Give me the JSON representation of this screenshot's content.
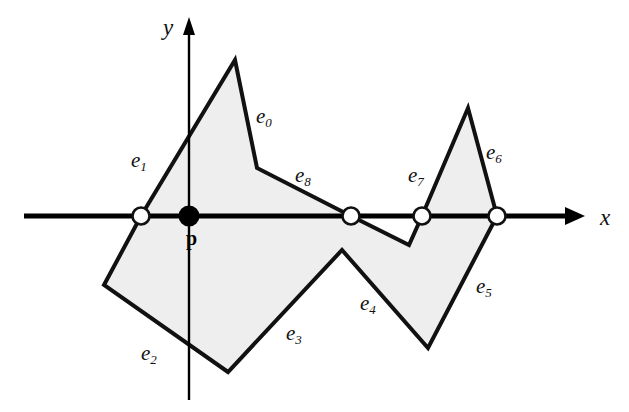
{
  "figure": {
    "background": "#ffffff",
    "polygon_fill": "#eeeeee",
    "polygon_stroke": "#111111",
    "axis_color": "#000000",
    "vertex_marker_fill": "#ffffff",
    "point_marker_fill": "#000000",
    "polygon_points": "235,60 257,168 351,216 409,245 422,216 468,108 497,216 428,348 342,250 228,372 104,285 141,216",
    "axes": {
      "x_axis": {
        "name": "x-axis",
        "x1": 24,
        "y1": 216,
        "x2": 584,
        "y2": 216,
        "label": "x",
        "label_x": 600,
        "label_y": 206
      },
      "y_axis": {
        "name": "y-axis",
        "x1": 189,
        "y1": 400,
        "x2": 189,
        "y2": 20,
        "label": "y",
        "label_x": 163,
        "label_y": 16
      }
    },
    "point": {
      "label": "p",
      "x": 189,
      "y": 216,
      "label_x": 186,
      "label_y": 228
    },
    "crossings": [
      {
        "name": "crossing-1",
        "x": 141,
        "y": 216
      },
      {
        "name": "crossing-2",
        "x": 351,
        "y": 216
      },
      {
        "name": "crossing-3",
        "x": 422,
        "y": 216
      },
      {
        "name": "crossing-4",
        "x": 497,
        "y": 216
      }
    ],
    "edge_labels": [
      {
        "id": "e0",
        "base": "e",
        "sub": "0",
        "x": 256,
        "y": 106
      },
      {
        "id": "e1",
        "base": "e",
        "sub": "1",
        "x": 131,
        "y": 150
      },
      {
        "id": "e2",
        "base": "e",
        "sub": "2",
        "x": 141,
        "y": 343
      },
      {
        "id": "e3",
        "base": "e",
        "sub": "3",
        "x": 286,
        "y": 323
      },
      {
        "id": "e4",
        "base": "e",
        "sub": "4",
        "x": 360,
        "y": 293
      },
      {
        "id": "e5",
        "base": "e",
        "sub": "5",
        "x": 476,
        "y": 276
      },
      {
        "id": "e6",
        "base": "e",
        "sub": "6",
        "x": 486,
        "y": 142
      },
      {
        "id": "e7",
        "base": "e",
        "sub": "7",
        "x": 408,
        "y": 165
      },
      {
        "id": "e8",
        "base": "e",
        "sub": "8",
        "x": 295,
        "y": 165
      }
    ]
  }
}
